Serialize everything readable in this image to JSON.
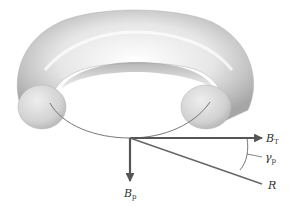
{
  "diagram": {
    "labels": {
      "bt": {
        "main": "B",
        "sub": "T"
      },
      "bp": {
        "main": "B",
        "sub": "p"
      },
      "gamma": {
        "main": "γ",
        "sub": "p"
      },
      "r": {
        "main": "R",
        "sub": ""
      }
    },
    "colors": {
      "torus_light": "#f2f2f2",
      "torus_mid": "#c8c8c8",
      "torus_dark": "#9a9a9a",
      "arrow": "#555555",
      "line": "#666666"
    }
  }
}
